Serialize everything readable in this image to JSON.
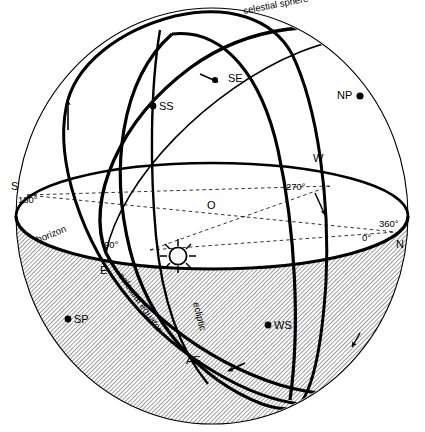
{
  "figure": {
    "background_color": "#ffffff",
    "line_color": "#000000",
    "hatch_color": "#555555"
  },
  "labels": {
    "celestial_sphere": "celestial sphere",
    "horizon": "horizon",
    "celestial_equator": "celestial equator",
    "ecliptic": "ecliptic",
    "center": "O",
    "north_pole": "NP",
    "south_pole": "SP",
    "summer_solstice": "SS",
    "winter_solstice": "WS",
    "spring_equinox": "SE",
    "autumn_equinox": "AE",
    "cardinal_south": "S",
    "cardinal_east": "E",
    "cardinal_west": "W",
    "cardinal_north": "N",
    "azimuth_180": "180°",
    "azimuth_270": "270°",
    "azimuth_360": "360°",
    "azimuth_0": "0°",
    "azimuth_90": "90°"
  },
  "markers": {
    "sun": "sun-symbol",
    "north_pole_dot": "point-marker",
    "south_pole_dot": "point-marker",
    "summer_solstice_dot": "point-marker",
    "winter_solstice_dot": "point-marker",
    "direction_arrows": [
      "arrow-up-left-meridian",
      "arrow-left-equator",
      "arrow-down-right-meridian",
      "arrow-lower-ecliptic",
      "arrow-lower-right-equator"
    ]
  }
}
